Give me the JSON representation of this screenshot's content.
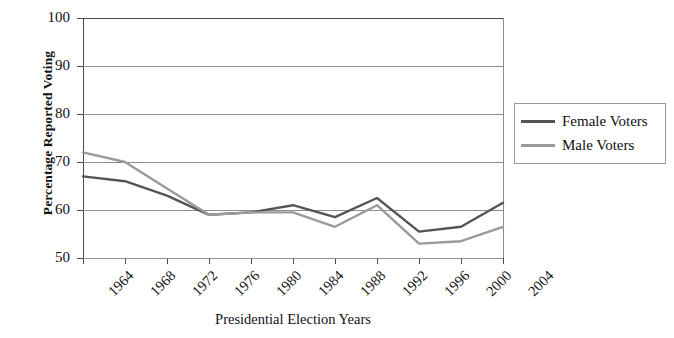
{
  "chart_data": {
    "type": "line",
    "title": "",
    "xlabel": "Presidential Election Years",
    "ylabel": "Percentage Reported Voting",
    "categories": [
      "1964",
      "1968",
      "1972",
      "1976",
      "1980",
      "1984",
      "1988",
      "1992",
      "1996",
      "2000",
      "2004"
    ],
    "series": [
      {
        "name": "Female Voters",
        "color": "#555555",
        "values": [
          67,
          66,
          63,
          59,
          59.5,
          61,
          58.5,
          62.5,
          55.5,
          56.5,
          61.5
        ]
      },
      {
        "name": "Male Voters",
        "color": "#9a9a9a",
        "values": [
          72,
          70,
          64.5,
          59,
          59.5,
          59.5,
          56.5,
          61,
          53,
          53.5,
          56.5
        ]
      }
    ],
    "ylim": [
      50,
      100
    ],
    "yticks": [
      50,
      60,
      70,
      80,
      90,
      100
    ],
    "ytick_labels": [
      "50",
      "60",
      "70",
      "80",
      "90",
      "100"
    ],
    "grid": true,
    "legend_position": "right"
  },
  "legend": {
    "entries": [
      {
        "label": "Female Voters",
        "color": "#555555"
      },
      {
        "label": "Male Voters",
        "color": "#9a9a9a"
      }
    ]
  },
  "axes": {
    "y_title": "Percentage Reported Voting",
    "x_title": "Presidential Election Years"
  }
}
